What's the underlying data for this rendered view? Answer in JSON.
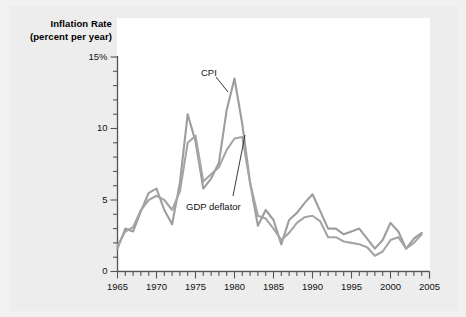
{
  "figure": {
    "background_color": "#ededed",
    "plot_background_color": "#ffffff"
  },
  "chart_data": {
    "type": "line",
    "title": "",
    "ylabel_line1": "Inflation Rate",
    "ylabel_line2": "(percent per year)",
    "xlabel": "",
    "xlim": [
      1965,
      2005
    ],
    "ylim": [
      0,
      15
    ],
    "grid": false,
    "legend_position": "inline-annotation",
    "y_tick_labels": [
      "15%",
      "10",
      "5",
      "0"
    ],
    "y_tick_values": [
      15,
      10,
      5,
      0
    ],
    "y_minor_tick_step": 1,
    "x_tick_labels": [
      "1965",
      "1970",
      "1975",
      "1980",
      "1985",
      "1990",
      "1995",
      "2000",
      "2005"
    ],
    "x_tick_values": [
      1965,
      1970,
      1975,
      1980,
      1985,
      1990,
      1995,
      2000,
      2005
    ],
    "x_minor_tick_step": 1,
    "x": [
      1965,
      1966,
      1967,
      1968,
      1969,
      1970,
      1971,
      1972,
      1973,
      1974,
      1975,
      1976,
      1977,
      1978,
      1979,
      1980,
      1981,
      1982,
      1983,
      1984,
      1985,
      1986,
      1987,
      1988,
      1989,
      1990,
      1991,
      1992,
      1993,
      1994,
      1995,
      1996,
      1997,
      1998,
      1999,
      2000,
      2001,
      2002,
      2003,
      2004
    ],
    "series": [
      {
        "name": "CPI",
        "color": "#9d9d9d",
        "values": [
          1.6,
          3.0,
          2.8,
          4.2,
          5.5,
          5.8,
          4.3,
          3.3,
          6.2,
          11.0,
          9.1,
          5.8,
          6.5,
          7.6,
          11.3,
          13.5,
          10.3,
          6.2,
          3.2,
          4.3,
          3.6,
          1.9,
          3.6,
          4.1,
          4.8,
          5.4,
          4.2,
          3.0,
          3.0,
          2.6,
          2.8,
          3.0,
          2.3,
          1.6,
          2.2,
          3.4,
          2.8,
          1.6,
          2.3,
          2.7
        ],
        "annotation": "CPI",
        "annotation_x": 1978.5,
        "annotation_y": 14.0
      },
      {
        "name": "GDP deflator",
        "color": "#a5a5a5",
        "values": [
          1.8,
          2.8,
          3.1,
          4.3,
          5.0,
          5.3,
          5.0,
          4.3,
          5.6,
          9.0,
          9.5,
          6.3,
          6.8,
          7.3,
          8.5,
          9.3,
          9.4,
          6.2,
          3.9,
          3.7,
          3.0,
          2.2,
          2.7,
          3.4,
          3.8,
          3.9,
          3.5,
          2.4,
          2.4,
          2.1,
          2.0,
          1.9,
          1.7,
          1.1,
          1.4,
          2.2,
          2.4,
          1.6,
          2.0,
          2.6
        ],
        "annotation": "GDP deflator",
        "annotation_x": 1981.0,
        "annotation_y": 5.0
      }
    ]
  }
}
